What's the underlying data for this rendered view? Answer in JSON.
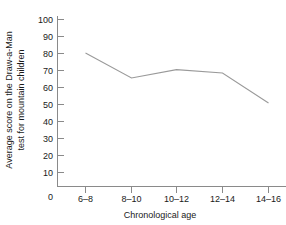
{
  "chart_data": {
    "type": "line",
    "title": "",
    "xlabel": "Chronological age",
    "ylabel": "Average score on the Draw-a-Man test for mountain children",
    "ylabel_line1": "Average score on the Draw-a-Man",
    "ylabel_line2": "test for mountain children",
    "categories": [
      "6–8",
      "8–10",
      "10–12",
      "12–14",
      "14–16"
    ],
    "values": [
      80,
      65,
      70,
      68,
      50
    ],
    "series": [
      {
        "name": "Average score",
        "values": [
          80,
          65,
          70,
          68,
          50
        ]
      }
    ],
    "ylim": [
      0,
      100
    ],
    "yticks": [
      0,
      10,
      20,
      30,
      40,
      50,
      60,
      70,
      80,
      90,
      100
    ],
    "ytick_labels": [
      "0",
      "10",
      "20",
      "30",
      "40",
      "50",
      "60",
      "70",
      "80",
      "90",
      "100"
    ],
    "xtick_labels": [
      "6–8",
      "8–10",
      "10–12",
      "12–14",
      "14–16"
    ],
    "grid": false,
    "legend": false,
    "line_color": "#9a9a9a",
    "axis_color": "#8a8a8a",
    "text_color": "#1a1a1a",
    "background_color": "#ffffff"
  }
}
